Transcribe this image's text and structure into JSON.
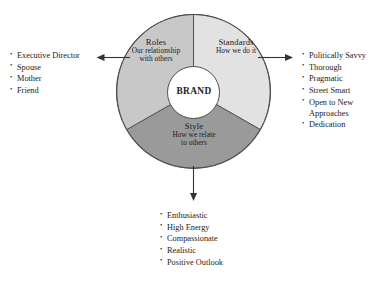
{
  "diagram": {
    "title": "BRAND",
    "center_label": "BRAND",
    "colors": {
      "roles": "#c8c8c8",
      "standards": "#e2e2e2",
      "style": "#9a9a9a",
      "center": "#ffffff",
      "outline": "#4d4d4d",
      "text": "#1a1a1a",
      "arrow": "#333333"
    },
    "sectors": [
      {
        "key": "roles",
        "title": "Roles",
        "subtitle": "Our relationship with others",
        "subtitle_lines": [
          "Our relationship",
          "with others"
        ],
        "fill": "#c8c8c8",
        "start_angle": 240,
        "end_angle": 360
      },
      {
        "key": "standards",
        "title": "Standards",
        "subtitle": "How we do it",
        "subtitle_lines": [
          "How we do it"
        ],
        "fill": "#e2e2e2",
        "start_angle": 0,
        "end_angle": 120
      },
      {
        "key": "style",
        "title": "Style",
        "subtitle": "How we relate to others",
        "subtitle_lines": [
          "How we relate",
          "to others"
        ],
        "fill": "#9a9a9a",
        "start_angle": 120,
        "end_angle": 240
      }
    ],
    "arrows": [
      {
        "key": "roles-arrow",
        "direction": "left"
      },
      {
        "key": "standards-arrow",
        "direction": "right"
      },
      {
        "key": "style-arrow",
        "direction": "down"
      }
    ]
  },
  "lists": {
    "roles": {
      "items": [
        "Executive Director",
        "Spouse",
        "Mother",
        "Friend"
      ]
    },
    "standards": {
      "items": [
        "Politically Savvy",
        "Thorough",
        "Pragmatic",
        "Street Smart",
        "Open to New Approaches",
        "Dedication"
      ]
    },
    "style": {
      "items": [
        "Enthusiastic",
        "High Energy",
        "Compassionate",
        "Realistic",
        "Positive Outlook"
      ]
    }
  }
}
